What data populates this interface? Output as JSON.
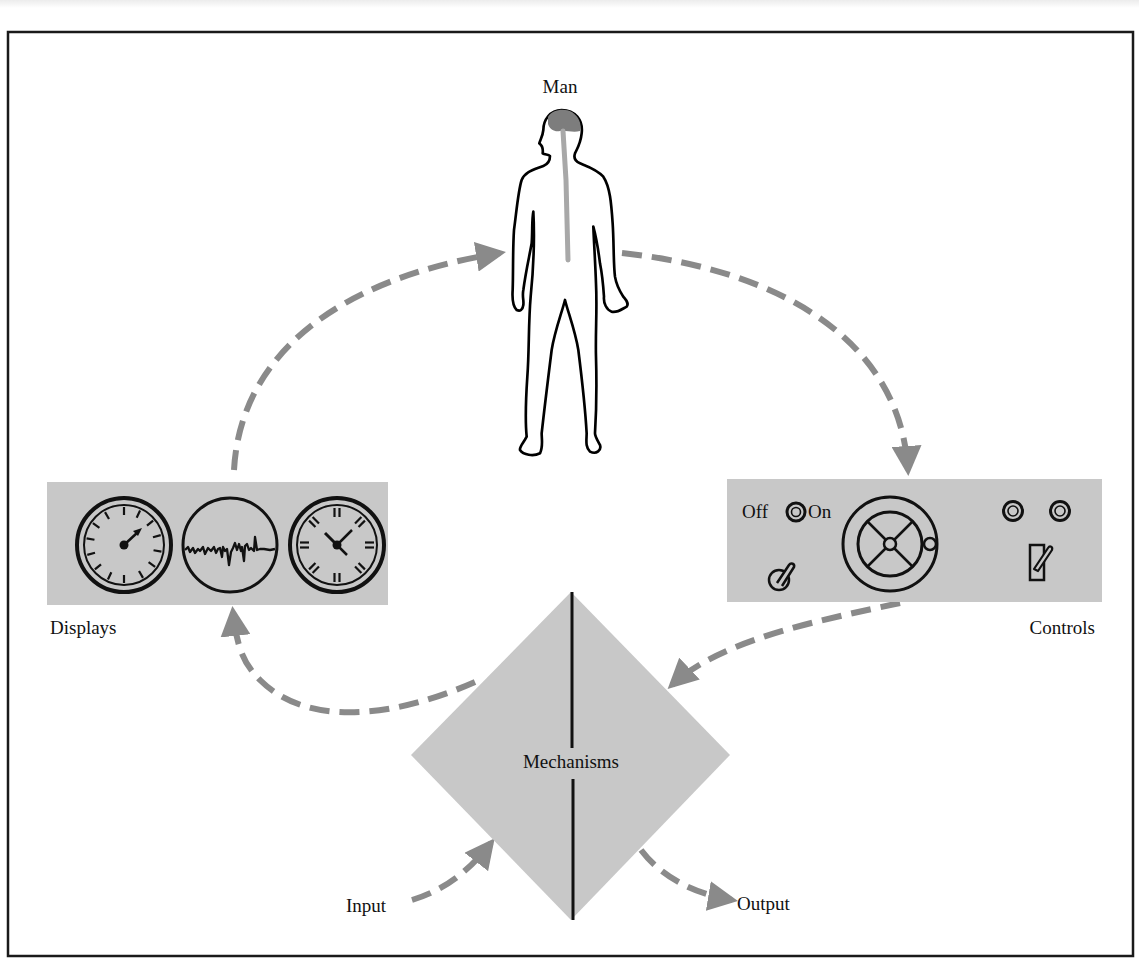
{
  "diagram": {
    "type": "man-machine-system loop",
    "nodes": {
      "man": {
        "label": "Man"
      },
      "displays": {
        "label": "Displays"
      },
      "controls": {
        "label": "Controls",
        "switch_off_label": "Off",
        "switch_on_label": "On"
      },
      "mechanisms": {
        "label": "Mechanisms"
      },
      "input": {
        "label": "Input"
      },
      "output": {
        "label": "Output"
      }
    },
    "edges": [
      {
        "from": "displays",
        "to": "man",
        "style": "dashed-arrow"
      },
      {
        "from": "man",
        "to": "controls",
        "style": "dashed-arrow"
      },
      {
        "from": "controls",
        "to": "mechanisms",
        "style": "dashed-arrow"
      },
      {
        "from": "mechanisms",
        "to": "displays",
        "style": "dashed-arrow"
      },
      {
        "from": "input",
        "to": "mechanisms",
        "style": "dashed-arrow"
      },
      {
        "from": "mechanisms",
        "to": "output",
        "style": "dashed-arrow"
      }
    ],
    "display_instruments": [
      "dial-gauge-icon",
      "waveform-scope-icon",
      "clock-icon"
    ],
    "control_instruments": [
      "off-on-rotary-switch",
      "steering-wheel-icon",
      "lever-knob-icon",
      "indicator-lights",
      "toggle-switch-icon"
    ],
    "colors": {
      "panel_gray": "#c8c8c8",
      "arrow_gray": "#8a8a8a",
      "brain_gray": "#7d7d7d",
      "spine_gray": "#a8a8a8",
      "line_black": "#111111",
      "frame_black": "#1a1a1a"
    }
  }
}
